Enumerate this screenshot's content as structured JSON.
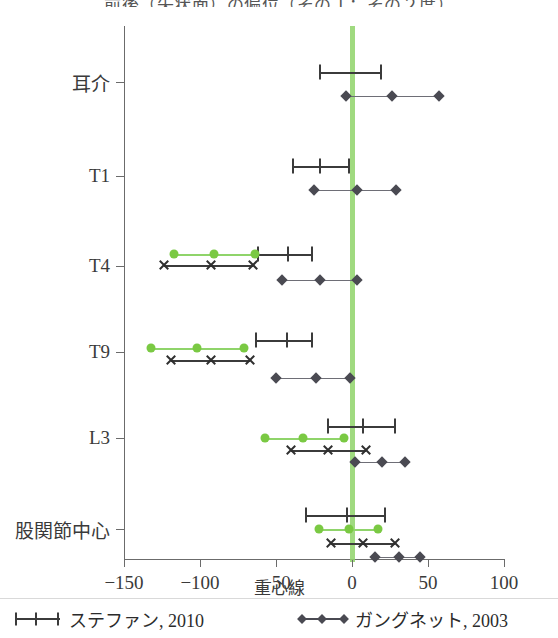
{
  "chart_data": {
    "type": "scatter",
    "title": "前後（矢状面）の偏位（その１：その２度）",
    "xlabel": "重心線",
    "ylabel": "",
    "xlim": [
      -150,
      100
    ],
    "xticks": [
      -150,
      -100,
      -50,
      0,
      50,
      100
    ],
    "xticklabels": [
      "-150",
      "-100",
      "-50",
      "0",
      "50",
      "100"
    ],
    "categories": [
      "耳介",
      "T1",
      "T4",
      "T9",
      "L3",
      "股関節中心"
    ],
    "grid": false,
    "reference_line": {
      "x": 0,
      "color": "#8fd46a",
      "label": "重心線"
    },
    "legend_position": "below",
    "series": [
      {
        "name": "ステファン, 2010",
        "marker": "plus",
        "color": "#3b3b3b",
        "points": {
          "耳介": [
            -21,
            19
          ],
          "T1": [
            -39,
            -21,
            -2
          ],
          "T4": [
            -62,
            -42,
            -26
          ],
          "T9": [
            -63,
            -43,
            -26
          ],
          "L3": [
            -16,
            7,
            28
          ],
          "股関節中心": [
            -30,
            -3,
            22
          ]
        }
      },
      {
        "name": "ガングネット, 2003",
        "marker": "diamond",
        "color": "#4a4a52",
        "points": {
          "耳介": [
            -4,
            26,
            57
          ],
          "T1": [
            -25,
            3,
            29
          ],
          "T4": [
            -46,
            -21,
            3
          ],
          "T9": [
            -50,
            -24,
            -1
          ],
          "L3": [
            2,
            20,
            35
          ],
          "股関節中心": [
            15,
            31,
            45
          ]
        }
      },
      {
        "name": "緑（円マーカー）",
        "marker": "circle",
        "color": "#7ac943",
        "points": {
          "T4": [
            -117,
            -91,
            -64
          ],
          "T9": [
            -132,
            -102,
            -71
          ],
          "L3": [
            -57,
            -32,
            -5
          ],
          "股関節中心": [
            -22,
            -2,
            17
          ]
        }
      },
      {
        "name": "黒（×マーカー）",
        "marker": "x",
        "color": "#2f2f2f",
        "points": {
          "T4": [
            -124,
            -93,
            -65
          ],
          "T9": [
            -119,
            -93,
            -67
          ],
          "L3": [
            -40,
            -16,
            9
          ],
          "股関節中心": [
            -14,
            7,
            28
          ]
        }
      }
    ]
  },
  "legend": {
    "items": [
      {
        "label": "ステファン, 2010",
        "marker": "plus-line",
        "color": "#3b3b3b"
      },
      {
        "label": "ガングネット, 2003",
        "marker": "diamond-line",
        "color": "#4a4a52"
      }
    ]
  }
}
